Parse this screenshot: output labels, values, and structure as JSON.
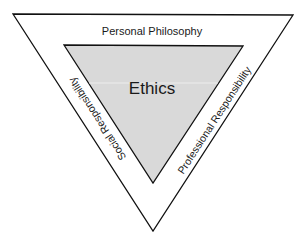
{
  "diagram": {
    "type": "nested-inverted-triangles",
    "outer_triangle": {
      "fill": "#ffffff",
      "stroke": "#111111",
      "labels": {
        "top": "Personal Philosophy",
        "left": "Social Responsibility",
        "right": "Professional Responsibility"
      }
    },
    "inner_triangle": {
      "fill": "#d9d9d9",
      "stroke": "#111111",
      "label": "Ethics"
    }
  }
}
